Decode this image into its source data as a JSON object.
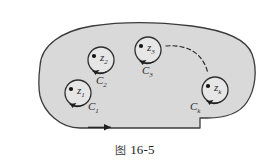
{
  "figure": {
    "caption_glyph": "图",
    "caption_text": "16-5",
    "region_fill": "#d9d9d9",
    "region_stroke": "#3c3c3c",
    "circle_fill": "#e6e6e6",
    "circle_stroke": "#2f2f2f",
    "label_color": "#2b2b2b",
    "background": "#ffffff"
  },
  "points": [
    {
      "id": "p1",
      "point_label": "z",
      "point_sub": "1",
      "curve_label": "C",
      "curve_sub": "1",
      "cx": 78,
      "cy": 93,
      "r": 13
    },
    {
      "id": "p2",
      "point_label": "z",
      "point_sub": "2",
      "curve_label": "C",
      "curve_sub": "2",
      "cx": 101,
      "cy": 60,
      "r": 13
    },
    {
      "id": "p3",
      "point_label": "z",
      "point_sub": "3",
      "curve_label": "C",
      "curve_sub": "3",
      "cx": 148,
      "cy": 50,
      "r": 13
    },
    {
      "id": "pk",
      "point_label": "z",
      "point_sub": "k",
      "curve_label": "C",
      "curve_sub": "k",
      "cx": 215,
      "cy": 90,
      "r": 13
    }
  ],
  "annotations": {
    "dashed_curve": "ellipsis-arc",
    "outer_arrow": "counterclockwise-direction-arrow",
    "inner_arrows": "clockwise-direction-arrow"
  }
}
